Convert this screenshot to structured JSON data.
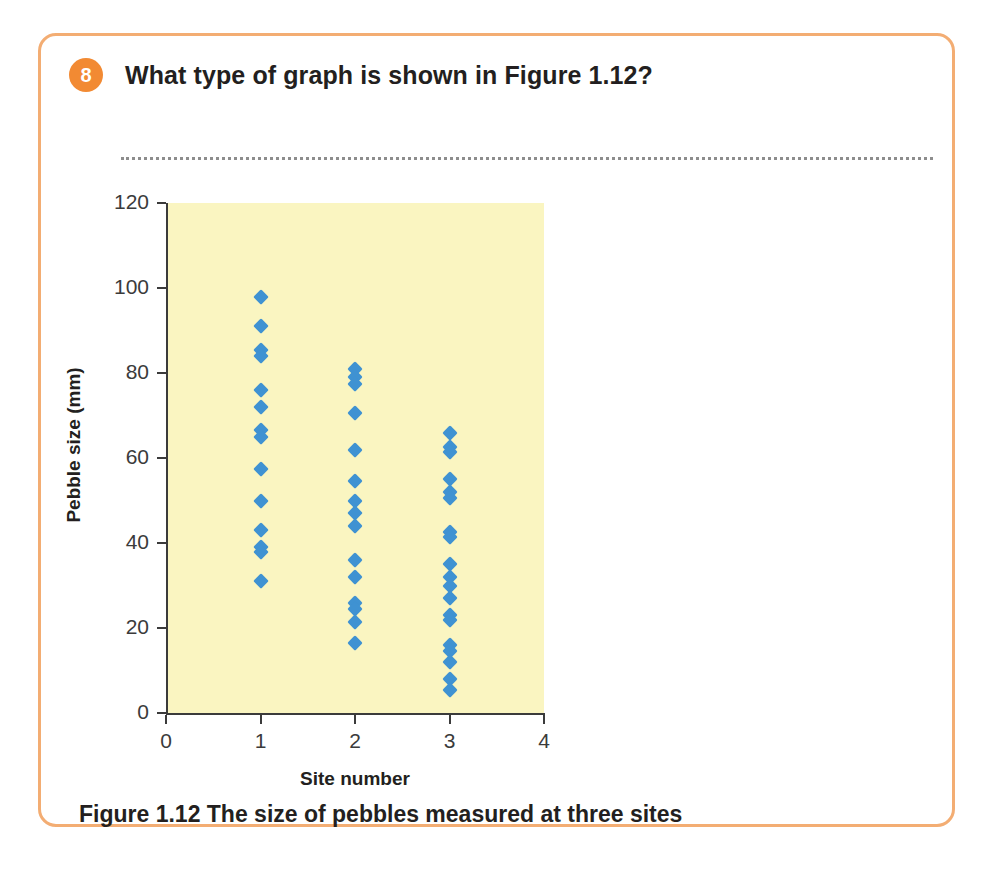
{
  "card": {
    "border_color": "#f3ad73"
  },
  "question": {
    "number": "8",
    "text": "What type of graph is shown in Figure 1.12?",
    "badge_color": "#f28a33",
    "answer_line_placeholder": ""
  },
  "figure": {
    "caption": "Figure 1.12 The size of pebbles measured at three sites"
  },
  "chart_data": {
    "type": "scatter",
    "title": "",
    "xlabel": "Site number",
    "ylabel": "Pebble size (mm)",
    "xlim": [
      0,
      4
    ],
    "ylim": [
      0,
      120
    ],
    "xticks": [
      0,
      1,
      2,
      3,
      4
    ],
    "yticks": [
      0,
      20,
      40,
      60,
      80,
      100,
      120
    ],
    "xtick_labels": [
      "0",
      "1",
      "2",
      "3",
      "4"
    ],
    "ytick_labels": [
      "0",
      "20",
      "40",
      "60",
      "80",
      "100",
      "120"
    ],
    "grid": false,
    "legend": "none",
    "plot_background": "#faf5c1",
    "marker_color": "#3f92d2",
    "marker_shape": "diamond",
    "series": [
      {
        "name": "Site 1",
        "x": 1,
        "values": [
          98,
          91,
          85.5,
          84,
          76,
          72,
          66.5,
          65,
          57.5,
          50,
          43,
          39,
          38,
          31
        ]
      },
      {
        "name": "Site 2",
        "x": 2,
        "values": [
          81,
          79,
          77.5,
          70.5,
          62,
          54.5,
          50,
          47,
          44,
          36,
          32,
          26,
          24.5,
          21.5,
          16.5
        ]
      },
      {
        "name": "Site 3",
        "x": 3,
        "values": [
          66,
          62.5,
          61.5,
          55,
          52,
          50.5,
          42.5,
          41.5,
          35,
          32,
          30,
          27,
          23,
          22,
          16,
          14.5,
          12,
          8,
          5.5
        ]
      }
    ]
  }
}
